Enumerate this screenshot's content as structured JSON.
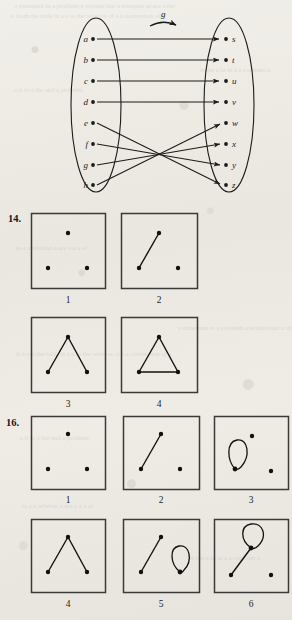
{
  "page": {
    "background_color": "#eceae4",
    "ink_color": "#1b1b1b"
  },
  "function_diagram": {
    "name": "arrow-diagram-function-g",
    "function_label": "g",
    "domain_labels": [
      "a",
      "b",
      "c",
      "d",
      "e",
      "f",
      "g",
      "h"
    ],
    "codomain_labels": [
      "s",
      "t",
      "u",
      "v",
      "w",
      "x",
      "y",
      "z"
    ],
    "mappings": [
      {
        "from": "a",
        "to": "s"
      },
      {
        "from": "b",
        "to": "t"
      },
      {
        "from": "c",
        "to": "u"
      },
      {
        "from": "d",
        "to": "v"
      },
      {
        "from": "e",
        "to": "z"
      },
      {
        "from": "f",
        "to": "y"
      },
      {
        "from": "g",
        "to": "x"
      },
      {
        "from": "h",
        "to": "w"
      }
    ]
  },
  "exercises": [
    {
      "number": "14.",
      "rows": [
        [
          {
            "caption": "1",
            "edges": [],
            "loops": []
          },
          {
            "caption": "2",
            "edges": [
              [
                "bottom-left",
                "top"
              ]
            ],
            "loops": []
          }
        ],
        [
          {
            "caption": "3",
            "edges": [
              [
                "bottom-left",
                "top"
              ],
              [
                "top",
                "bottom-right"
              ]
            ],
            "loops": []
          },
          {
            "caption": "4",
            "edges": [
              [
                "bottom-left",
                "top"
              ],
              [
                "top",
                "bottom-right"
              ],
              [
                "bottom-left",
                "bottom-right"
              ]
            ],
            "loops": []
          }
        ]
      ]
    },
    {
      "number": "16.",
      "rows": [
        [
          {
            "caption": "1",
            "edges": [],
            "loops": []
          },
          {
            "caption": "2",
            "edges": [
              [
                "bottom-left",
                "top"
              ]
            ],
            "loops": []
          },
          {
            "caption": "3",
            "edges": [],
            "loops": [
              "bottom-left"
            ]
          }
        ],
        [
          {
            "caption": "4",
            "edges": [
              [
                "bottom-left",
                "top"
              ],
              [
                "top",
                "bottom-right"
              ]
            ],
            "loops": []
          },
          {
            "caption": "5",
            "edges": [
              [
                "bottom-left",
                "top"
              ]
            ],
            "loops": [
              "bottom-right"
            ]
          },
          {
            "caption": "6",
            "edges": [
              [
                "bottom-left",
                "top"
              ]
            ],
            "loops": [
              "top"
            ]
          }
        ]
      ]
    }
  ],
  "bleed_through_text": {
    "line1": "a statement in a problem a written that a interpret as are a the",
    "line2": "is from the table is a a to the relation of a a convention of a",
    "line3": "is the a in in a a   consider a",
    "line4": "a it to a    the and a problem",
    "line5": "to a a relation a are   a a a of"
  }
}
